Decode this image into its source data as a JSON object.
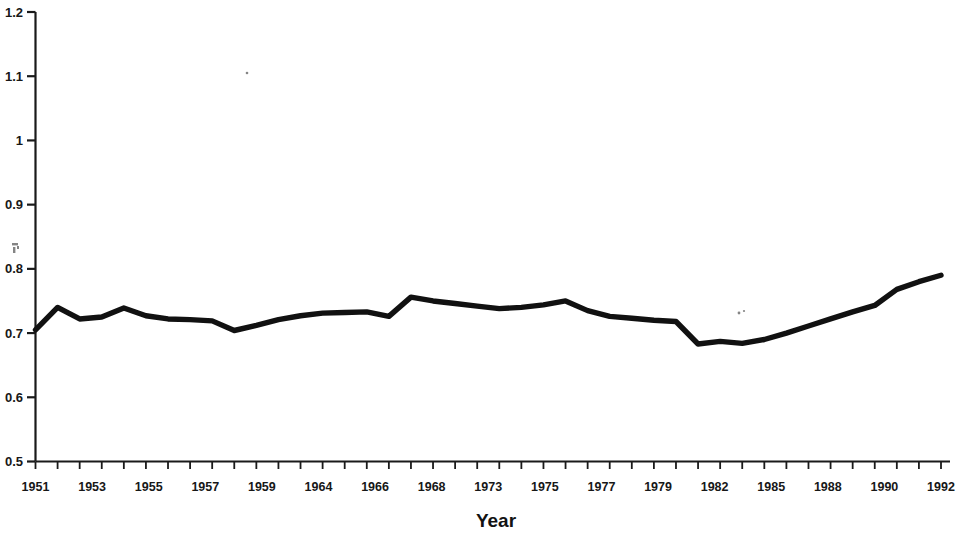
{
  "chart_data": {
    "type": "line",
    "title": "",
    "subtitle": "",
    "xlabel": "Year",
    "ylabel": "",
    "xlim": [
      1951,
      1992
    ],
    "ylim": [
      0.5,
      1.2
    ],
    "grid": false,
    "legend": null,
    "y_ticks": [
      "0.5",
      "0.6",
      "0.7",
      "0.8",
      "0.9",
      "1",
      "1.1",
      "1.2"
    ],
    "y_tick_values": [
      0.5,
      0.6,
      0.7,
      0.8,
      0.9,
      1.0,
      1.1,
      1.2
    ],
    "x_tick_labels": [
      "1951",
      "1953",
      "1955",
      "1957",
      "1959",
      "1964",
      "1966",
      "1968",
      "1973",
      "1975",
      "1977",
      "1979",
      "1982",
      "1985",
      "1988",
      "1990",
      "1992"
    ],
    "categories": [
      1951,
      1952,
      1953,
      1954,
      1955,
      1956,
      1957,
      1958,
      1959,
      1960,
      1961,
      1962,
      1963,
      1964,
      1965,
      1966,
      1967,
      1968,
      1969,
      1970,
      1971,
      1972,
      1973,
      1974,
      1975,
      1976,
      1977,
      1978,
      1979,
      1980,
      1981,
      1982,
      1983,
      1984,
      1985,
      1986,
      1987,
      1988,
      1989,
      1990,
      1991,
      1992
    ],
    "values": [
      0.705,
      0.74,
      0.722,
      0.725,
      0.739,
      0.727,
      0.722,
      0.721,
      0.719,
      0.704,
      0.712,
      0.721,
      0.727,
      0.731,
      0.732,
      0.733,
      0.726,
      0.756,
      0.75,
      0.746,
      0.742,
      0.738,
      0.74,
      0.744,
      0.75,
      0.735,
      0.726,
      0.723,
      0.72,
      0.718,
      0.683,
      0.687,
      0.684,
      0.69,
      0.7,
      0.711,
      0.722,
      0.733,
      0.743,
      0.768,
      0.78,
      0.79
    ],
    "series": [
      {
        "name": "",
        "color": "#111111",
        "values": [
          0.705,
          0.74,
          0.722,
          0.725,
          0.739,
          0.727,
          0.722,
          0.721,
          0.719,
          0.704,
          0.712,
          0.721,
          0.727,
          0.731,
          0.732,
          0.733,
          0.726,
          0.756,
          0.75,
          0.746,
          0.742,
          0.738,
          0.74,
          0.744,
          0.75,
          0.735,
          0.726,
          0.723,
          0.72,
          0.718,
          0.683,
          0.687,
          0.684,
          0.69,
          0.7,
          0.711,
          0.722,
          0.733,
          0.743,
          0.768,
          0.78,
          0.79
        ]
      }
    ],
    "annotations": []
  },
  "axes": {
    "x_title": "Year"
  },
  "colors": {
    "line": "#111111",
    "axis": "#1a1a1a",
    "text": "#171717",
    "background": "#ffffff"
  }
}
